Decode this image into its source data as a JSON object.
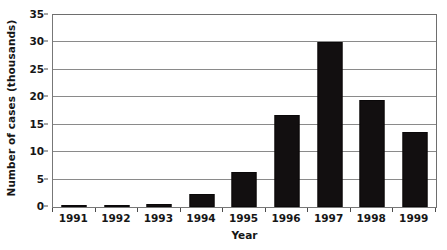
{
  "chart_data": {
    "type": "bar",
    "title": "",
    "xlabel": "Year",
    "ylabel": "Number of cases (thousands)",
    "categories": [
      "1991",
      "1992",
      "1993",
      "1994",
      "1995",
      "1996",
      "1997",
      "1998",
      "1999"
    ],
    "values": [
      0.3,
      0.4,
      0.6,
      2.4,
      6.3,
      16.7,
      30.0,
      19.5,
      13.7
    ],
    "ylim": [
      0,
      35
    ],
    "ytick_labels": [
      "0",
      "5",
      "10",
      "15",
      "20",
      "25",
      "30",
      "35"
    ],
    "ytick_values": [
      0,
      5,
      10,
      15,
      20,
      25,
      30,
      35
    ],
    "grid": true,
    "grid_axis": "y",
    "legend": false,
    "legend_position": "none",
    "bar_color": "#120f10",
    "grid_color": "#8a8a8a",
    "axis_color": "#777777",
    "background_color": "#ffffff"
  }
}
